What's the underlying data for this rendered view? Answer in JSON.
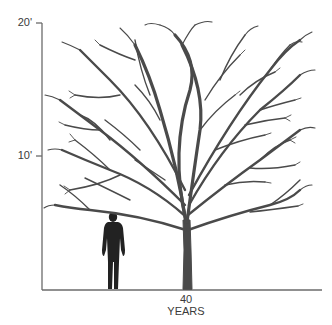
{
  "figure": {
    "type": "tree-size-diagram",
    "y_axis": {
      "ticks": [
        {
          "label": "20'",
          "value_ft": 20
        },
        {
          "label": "10'",
          "value_ft": 10
        }
      ]
    },
    "x_axis": {
      "age_value": "40",
      "age_unit": "YEARS"
    },
    "subjects": [
      {
        "name": "human-silhouette",
        "description": "standing person for scale"
      },
      {
        "name": "tree",
        "description": "deciduous tree, bare branches, broad rounded crown"
      }
    ],
    "colors": {
      "axis": "#6b6b6b",
      "tree": "#4a4a4a",
      "person": "#222222",
      "text": "#3a3a3a"
    }
  }
}
